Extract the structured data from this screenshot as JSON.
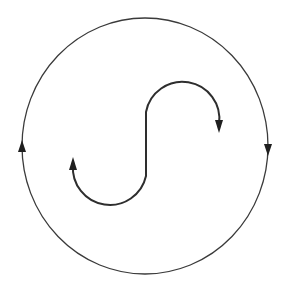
{
  "diagram": {
    "colors": {
      "background": "#ffffff",
      "outer_stroke": "#3a3a3a",
      "inner_stroke": "#2e2e2e",
      "arrowhead": "#1f1f1f"
    },
    "outer_circle": {
      "cx": 145,
      "cy": 146,
      "rx": 123,
      "ry": 128,
      "stroke_width": 1.3,
      "arrows": [
        {
          "name": "left-up-arrow",
          "x": 22,
          "tip_y": 140,
          "direction": "up"
        },
        {
          "name": "right-down-arrow",
          "x": 268,
          "tip_y": 156,
          "direction": "down"
        }
      ]
    },
    "s_curve": {
      "stroke_width": 2,
      "path": "M 219 124 A 37 37 0 0 0 146 112 L 146 176 A 37 37 0 0 1 73 165",
      "arrows": [
        {
          "name": "upper-right-down-arrow",
          "x": 219,
          "tip_y": 133,
          "direction": "down"
        },
        {
          "name": "lower-left-up-arrow",
          "x": 73,
          "tip_y": 157,
          "direction": "up"
        }
      ]
    }
  }
}
